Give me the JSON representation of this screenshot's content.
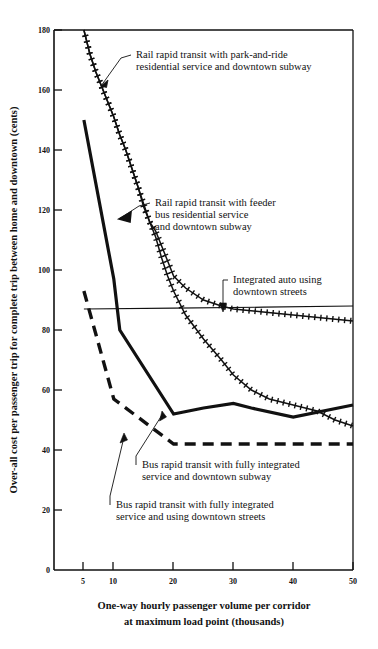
{
  "chart_data": {
    "type": "line",
    "title": "",
    "xlabel": "One-way hourly passenger volume per corridor at maximum load point (thousands)",
    "ylabel": "Over-all cost per passenger trip for complete trip between home and downtown (cents)",
    "xlim": [
      0,
      50
    ],
    "ylim": [
      0,
      180
    ],
    "grid": false,
    "legend_position": "inline-annotations",
    "xticks": [
      "5",
      "10",
      "20",
      "30",
      "40",
      "50"
    ],
    "xtick_values": [
      5,
      10,
      20,
      30,
      40,
      50
    ],
    "x_origin_label": "0",
    "yticks": [
      "0",
      "20",
      "40",
      "60",
      "80",
      "100",
      "120",
      "140",
      "160",
      "180"
    ],
    "ytick_values": [
      0,
      20,
      40,
      60,
      80,
      100,
      120,
      140,
      160,
      180
    ],
    "series": [
      {
        "name": "Rail rapid transit with park-and-ride residential service and downtown subway",
        "style": "cross-hatched",
        "x": [
          5,
          6,
          7,
          8,
          9,
          10,
          11,
          12,
          13,
          14,
          15,
          16,
          17,
          18,
          19,
          20,
          22,
          25,
          28,
          30,
          35,
          40,
          45,
          50
        ],
        "y": [
          180,
          172,
          166,
          161,
          156,
          151,
          145,
          140,
          134,
          128,
          122,
          116,
          113,
          108,
          103,
          98,
          94,
          90,
          88,
          87,
          86,
          85,
          84,
          83
        ]
      },
      {
        "name": "Rail rapid transit with feeder bus residential service and downtown subway",
        "style": "cross-hatched",
        "x": [
          5,
          6,
          7,
          8,
          9,
          10,
          11,
          12,
          13,
          14,
          15,
          16,
          17,
          18,
          19,
          20,
          22,
          25,
          28,
          30,
          33,
          36,
          40,
          44,
          47,
          50
        ],
        "y": [
          180,
          172,
          166,
          161,
          156,
          151,
          145,
          140,
          134,
          128,
          121,
          116,
          111,
          104,
          98,
          93,
          85,
          77,
          70,
          65,
          60,
          57,
          55,
          53,
          50,
          48
        ]
      },
      {
        "name": "Integrated auto using downtown streets",
        "style": "thin-solid",
        "x": [
          5,
          20,
          35,
          50
        ],
        "y": [
          87,
          87.3,
          87.6,
          88
        ]
      },
      {
        "name": "Bus rapid transit with fully integrated service and downtown subway",
        "style": "thick-solid",
        "x": [
          5,
          10,
          11,
          20,
          25,
          30,
          33,
          40,
          50
        ],
        "y": [
          150,
          97,
          80,
          52,
          54,
          55.5,
          54,
          51,
          55
        ]
      },
      {
        "name": "Bus rapid transit with fully integrated service and using downtown streets",
        "style": "thick-dashed",
        "x": [
          5,
          10,
          20,
          50
        ],
        "y": [
          93,
          57,
          42,
          42
        ]
      }
    ],
    "annotations": [
      {
        "id": "annot-park-and-ride",
        "lines": [
          "Rail rapid transit with park-and-ride",
          "residential service and downtown subway"
        ]
      },
      {
        "id": "annot-feeder-bus",
        "lines": [
          "Rail rapid transit with feeder",
          "bus residential service",
          "and downtown subway"
        ]
      },
      {
        "id": "annot-integrated-auto",
        "lines": [
          "Integrated auto using",
          "downtown streets"
        ]
      },
      {
        "id": "annot-bus-subway",
        "lines": [
          "Bus rapid transit with fully integrated",
          "service and downtown subway"
        ]
      },
      {
        "id": "annot-bus-streets",
        "lines": [
          "Bus rapid transit with fully integrated",
          "service and using downtown streets"
        ]
      }
    ]
  },
  "axis": {
    "x_title_line1": "One-way hourly passenger volume per corridor",
    "x_title_line2": "at maximum load point (thousands)",
    "y_title": "Over-all cost per passenger trip for complete trip between home and downtown (cents)"
  },
  "colors": {
    "ink": "#111111",
    "background": "#ffffff"
  }
}
